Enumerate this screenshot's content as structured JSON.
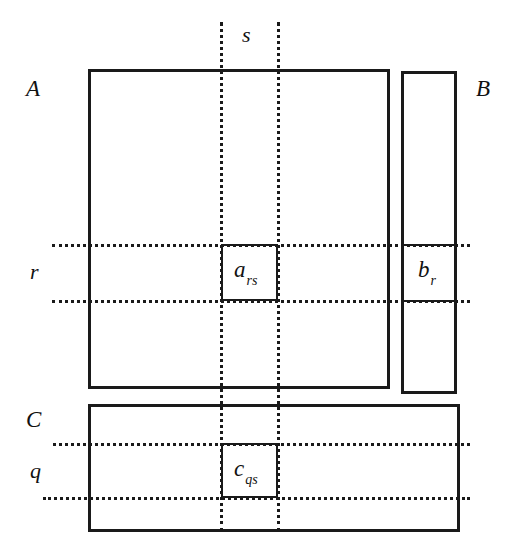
{
  "figure": {
    "type": "matrix-block-diagram",
    "background_color": "#ffffff",
    "line_color": "#1a1a1a"
  },
  "matrices": [
    {
      "id": "A",
      "label": "A",
      "shape": "square",
      "label_position": "outside-top-left",
      "entry": {
        "base": "a",
        "subscript": "rs"
      }
    },
    {
      "id": "B",
      "label": "B",
      "shape": "column-vector",
      "label_position": "outside-top-right",
      "entry": {
        "base": "b",
        "subscript": "r"
      }
    },
    {
      "id": "C",
      "label": "C",
      "shape": "wide-rectangle",
      "label_position": "outside-top-left",
      "entry": {
        "base": "c",
        "subscript": "qs"
      }
    }
  ],
  "guides": {
    "column_index": "s",
    "row_indices": [
      "r",
      "q"
    ]
  },
  "labels": {
    "A": "A",
    "B": "B",
    "C": "C",
    "s": "s",
    "r": "r",
    "q": "q"
  },
  "entries": {
    "a_rs": {
      "base": "a",
      "sub": "rs"
    },
    "b_r": {
      "base": "b",
      "sub": "r"
    },
    "c_qs": {
      "base": "c",
      "sub": "qs"
    }
  }
}
